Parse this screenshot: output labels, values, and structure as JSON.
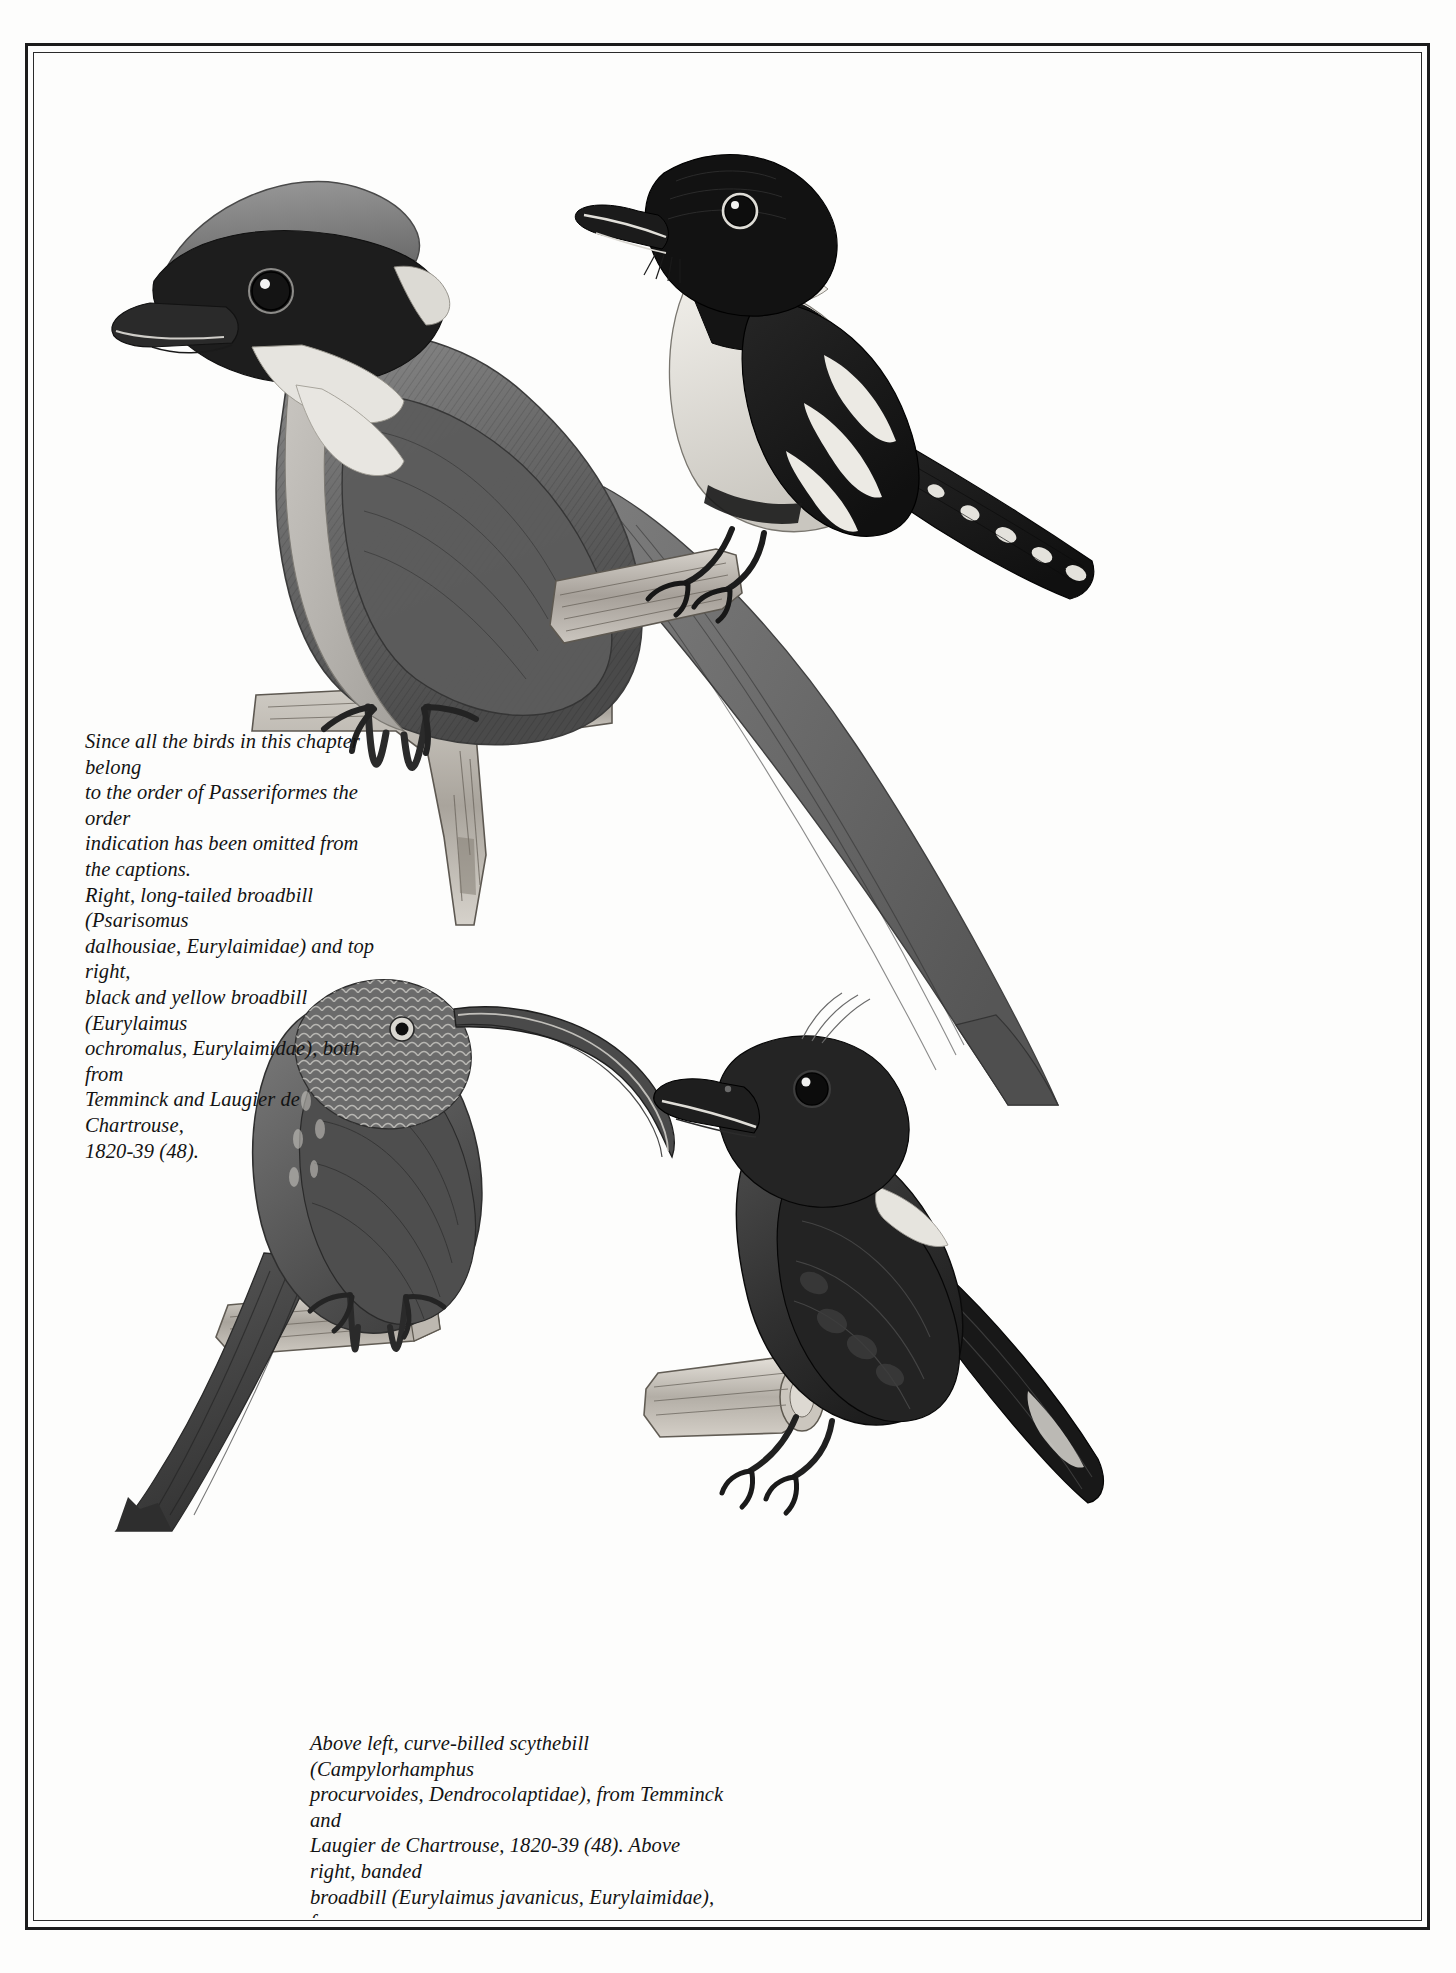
{
  "page": {
    "kind": "book-plate",
    "background_color": "#fdfdfc",
    "frame_color": "#1b1b1b"
  },
  "captions": {
    "top": {
      "lines": [
        "Since all the birds in this chapter belong",
        "to the order of Passeriformes the order",
        "indication has been omitted from",
        "the captions.",
        "Right, long-tailed broadbill (Psarisomus",
        "dalhousiae, Eurylaimidae) and top right,",
        "black and yellow broadbill (Eurylaimus",
        "ochromalus, Eurylaimidae), both from",
        "Temminck and Laugier de Chartrouse,",
        "1820-39 (48)."
      ]
    },
    "bottom": {
      "lines": [
        "Above left, curve-billed scythebill (Campylorhamphus",
        "procurvoides, Dendrocolaptidae), from Temminck and",
        "Laugier de Chartrouse, 1820-39 (48). Above right, banded",
        "broadbill (Eurylaimus javanicus, Eurylaimidae), from",
        "Cuvier, 1836-49 (9)."
      ]
    }
  },
  "figures": [
    {
      "id": "long-tailed-broadbill",
      "position": "left, upper",
      "common_name": "long-tailed broadbill",
      "scientific_name": "Psarisomus dalhousiae",
      "family": "Eurylaimidae",
      "source": "Temminck and Laugier de Chartrouse, 1820-39 (48)"
    },
    {
      "id": "black-and-yellow-broadbill",
      "position": "top right",
      "common_name": "black and yellow broadbill",
      "scientific_name": "Eurylaimus ochromalus",
      "family": "Eurylaimidae",
      "source": "Temminck and Laugier de Chartrouse, 1820-39 (48)"
    },
    {
      "id": "curve-billed-scythebill",
      "position": "above left",
      "common_name": "curve-billed scythebill",
      "scientific_name": "Campylorhamphus procurvoides",
      "family": "Dendrocolaptidae",
      "source": "Temminck and Laugier de Chartrouse, 1820-39 (48)"
    },
    {
      "id": "banded-broadbill",
      "position": "above right",
      "common_name": "banded broadbill",
      "scientific_name": "Eurylaimus javanicus",
      "family": "Eurylaimidae",
      "source": "Cuvier, 1836-49 (9)"
    }
  ],
  "palette": {
    "ink_black": "#121212",
    "dark_gray": "#3a3a3a",
    "mid_gray": "#6e6e6e",
    "light_gray": "#b6b6b6",
    "paper": "#fdfdfc"
  }
}
